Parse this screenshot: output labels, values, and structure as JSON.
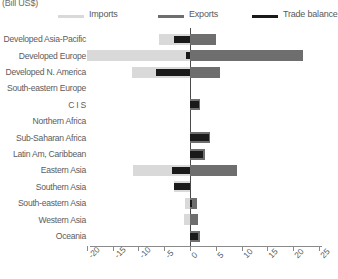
{
  "unit_label": "(Bill US$)",
  "legend": {
    "items": [
      {
        "label": "Imports",
        "color": "#d9d9d9",
        "name": "legend-imports"
      },
      {
        "label": "Exports",
        "color": "#6e6e6e",
        "name": "legend-exports"
      },
      {
        "label": "Trade balance",
        "color": "#1a1a1a",
        "name": "legend-trade-balance"
      }
    ]
  },
  "chart_data": {
    "type": "bar",
    "orientation": "horizontal",
    "title": "",
    "subtitle": "",
    "xlabel": "(Bill US$)",
    "ylabel": "",
    "xlim": [
      -20,
      25
    ],
    "xticks": [
      -20,
      -15,
      -10,
      -5,
      0,
      5,
      10,
      15,
      20,
      25
    ],
    "xticklabels": [
      "-20",
      "-15",
      "-10",
      "-5",
      "0",
      "5",
      "10",
      "15",
      "20",
      "25"
    ],
    "grid": false,
    "legend_position": "top",
    "categories": [
      "Developed Asia-Pacific",
      "Developed Europe",
      "Developed N. America",
      "South-eastern Europe",
      "C I S",
      "Northern Africa",
      "Sub-Saharan Africa",
      "Latin Am, Caribbean",
      "Eastern Asia",
      "Southern Asia",
      "South-eastern Asia",
      "Western Asia",
      "Oceania"
    ],
    "series": [
      {
        "name": "Imports",
        "color": "#d9d9d9",
        "values": [
          -6.0,
          -20.0,
          -11.2,
          0.0,
          0.0,
          0.0,
          0.0,
          0.0,
          -11.0,
          -3.2,
          -0.9,
          -1.1,
          0.0
        ]
      },
      {
        "name": "Exports",
        "color": "#6e6e6e",
        "values": [
          5.0,
          22.0,
          5.8,
          0.0,
          1.9,
          0.0,
          3.8,
          3.0,
          9.2,
          0.0,
          1.3,
          1.5,
          1.9
        ]
      },
      {
        "name": "Trade balance",
        "color": "#1a1a1a",
        "values": [
          -3.2,
          -0.8,
          -6.5,
          0.0,
          1.7,
          0.0,
          3.7,
          2.6,
          -3.4,
          -3.1,
          0.4,
          0.0,
          1.6
        ]
      }
    ]
  }
}
